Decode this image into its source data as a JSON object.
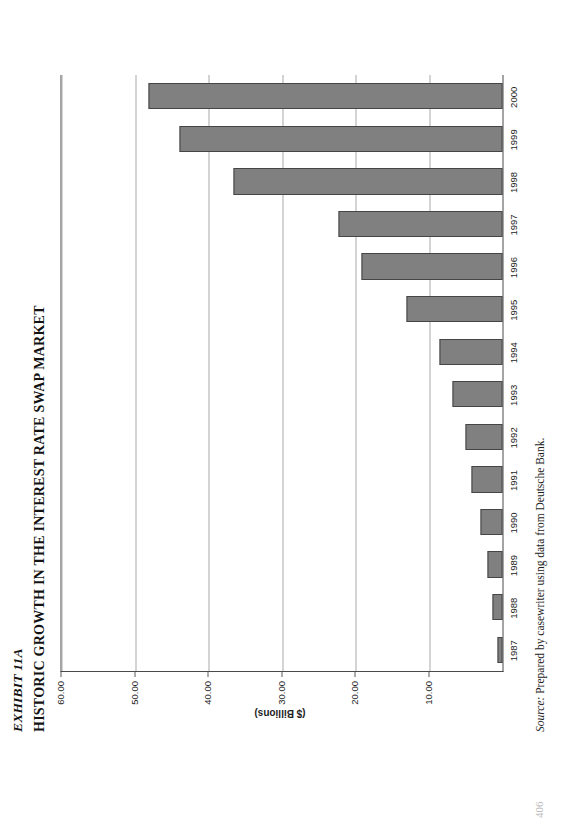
{
  "page": {
    "number": "406",
    "exhibit_label": "EXHIBIT 11A",
    "exhibit_title": "HISTORIC GROWTH IN THE INTEREST RATE SWAP MARKET",
    "source_lead": "Source:",
    "source_text": " Prepared by casewriter using data from Deutsche Bank.",
    "background_color": "#ffffff",
    "text_color": "#121212"
  },
  "chart_data": {
    "type": "bar",
    "orientation": "vertical",
    "title": "HISTORIC GROWTH IN THE INTEREST RATE SWAP MARKET",
    "subtitle": "",
    "xlabel": "",
    "ylabel": "($ Billions)",
    "categories": [
      "1987",
      "1988",
      "1989",
      "1990",
      "1991",
      "1992",
      "1993",
      "1994",
      "1995",
      "1996",
      "1997",
      "1998",
      "1999",
      "2000"
    ],
    "values": [
      0.7,
      1.3,
      2.0,
      3.0,
      4.2,
      5.1,
      6.8,
      8.6,
      13.0,
      19.2,
      22.3,
      36.6,
      44.0,
      48.1
    ],
    "ylim": [
      0,
      60
    ],
    "ytick_values": [
      10,
      20,
      30,
      40,
      50,
      60
    ],
    "ytick_labels": [
      "10.00",
      "20.00",
      "30.00",
      "40.00",
      "50.00",
      "60.00"
    ],
    "grid": true,
    "grid_axis": "value",
    "legend": false,
    "legend_position": "none",
    "bar_fill_color": "#808080",
    "bar_border_color": "#454545",
    "plot_border_color": "#4a4a4a",
    "gridline_color": "#a9a9a9"
  }
}
